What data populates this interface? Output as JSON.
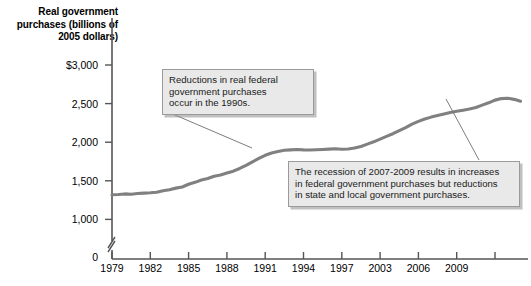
{
  "chart_data": {
    "type": "line",
    "title": "",
    "ylabel": "Real government purchases (billions of 2005 dollars)",
    "xlabel": "",
    "ylim": [
      900,
      3000
    ],
    "xlim": [
      1979,
      2011.5
    ],
    "grid": false,
    "legend": "none",
    "axis_break": true,
    "y_ticks": [
      "$3,000",
      "2,500",
      "2,000",
      "1,500",
      "1,000",
      "0"
    ],
    "y_tick_values": [
      3000,
      2500,
      2000,
      1500,
      1000,
      0
    ],
    "x_ticks": [
      "1979",
      "1982",
      "1985",
      "1988",
      "1991",
      "1994",
      "1997",
      "2003",
      "2006",
      "2009"
    ],
    "x_tick_values": [
      1979,
      1982,
      1985,
      1988,
      1991,
      1994,
      1997,
      2000,
      2003,
      2006
    ],
    "series": [
      {
        "name": "Real government purchases",
        "color": "#808080",
        "x": [
          1979,
          1979.5,
          1980,
          1980.5,
          1981,
          1981.5,
          1982,
          1982.5,
          1983,
          1983.5,
          1984,
          1984.5,
          1985,
          1985.5,
          1986,
          1986.5,
          1987,
          1987.5,
          1988,
          1988.5,
          1989,
          1989.5,
          1990,
          1990.5,
          1991,
          1991.5,
          1992,
          1992.5,
          1993,
          1993.5,
          1994,
          1994.5,
          1995,
          1995.5,
          1996,
          1996.5,
          1997,
          1997.5,
          1998,
          1998.5,
          1999,
          1999.5,
          2000,
          2000.5,
          2001,
          2001.5,
          2002,
          2002.5,
          2003,
          2003.5,
          2004,
          2004.5,
          2005,
          2005.5,
          2006,
          2006.5,
          2007,
          2007.5,
          2008,
          2008.5,
          2009,
          2009.5,
          2010,
          2010.5,
          2011
        ],
        "values": [
          1320,
          1322,
          1330,
          1325,
          1335,
          1340,
          1345,
          1352,
          1370,
          1385,
          1405,
          1420,
          1455,
          1480,
          1510,
          1530,
          1560,
          1575,
          1600,
          1625,
          1660,
          1700,
          1745,
          1790,
          1830,
          1860,
          1880,
          1895,
          1900,
          1905,
          1900,
          1898,
          1902,
          1906,
          1910,
          1915,
          1908,
          1912,
          1925,
          1945,
          1975,
          2005,
          2040,
          2075,
          2110,
          2150,
          2190,
          2235,
          2270,
          2300,
          2325,
          2345,
          2365,
          2385,
          2400,
          2415,
          2430,
          2450,
          2480,
          2510,
          2545,
          2565,
          2570,
          2555,
          2530
        ]
      }
    ],
    "annotations": [
      {
        "id": "callout-1",
        "lines": [
          "Reductions in real federal",
          "government purchases",
          "occur in the 1990s."
        ],
        "leader_from": [
          168,
          112
        ],
        "leader_to": [
          252,
          148
        ]
      },
      {
        "id": "callout-2",
        "lines": [
          "The recession of 2007-2009 results in increases",
          "in federal government purchases but reductions",
          "in state and local government purchases."
        ],
        "leader_from": [
          479,
          160
        ],
        "leader_to": [
          446,
          99
        ]
      }
    ]
  }
}
